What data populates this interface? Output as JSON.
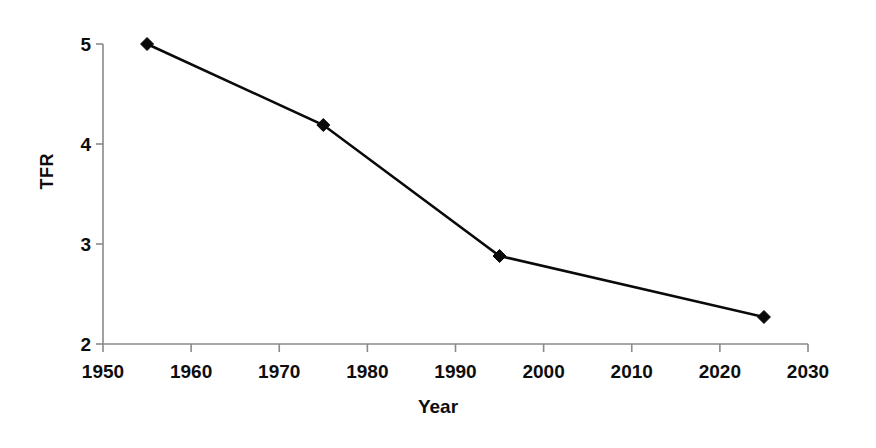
{
  "chart_data": {
    "type": "line",
    "title": "",
    "subtitle": "",
    "xlabel": "Year",
    "ylabel": "TFR",
    "xlim": [
      1950,
      2030
    ],
    "ylim": [
      2,
      5
    ],
    "grid": false,
    "legend": null,
    "legend_position": "none",
    "x_tick_labels": [
      "1950",
      "1960",
      "1970",
      "1980",
      "1990",
      "2000",
      "2010",
      "2020",
      "2030"
    ],
    "x_ticks": [
      1950,
      1960,
      1970,
      1980,
      1990,
      2000,
      2010,
      2020,
      2030
    ],
    "y_tick_labels": [
      "2",
      "3",
      "4",
      "5"
    ],
    "y_ticks": [
      2,
      3,
      4,
      5
    ],
    "marker": "diamond",
    "line_color": "#0a0a0a",
    "marker_color": "#0a0a0a",
    "axis_color": "#8a8a8a",
    "background_color": "#ffffff",
    "x": [
      1955,
      1975,
      1995,
      2025
    ],
    "values": [
      5.0,
      4.19,
      2.88,
      2.27
    ],
    "points": [
      {
        "x": 1955,
        "y": 5.0
      },
      {
        "x": 1975,
        "y": 4.19
      },
      {
        "x": 1995,
        "y": 2.88
      },
      {
        "x": 2025,
        "y": 2.27
      }
    ],
    "series": [
      {
        "name": "TFR",
        "x": [
          1955,
          1975,
          1995,
          2025
        ],
        "values": [
          5.0,
          4.19,
          2.88,
          2.27
        ]
      }
    ]
  }
}
